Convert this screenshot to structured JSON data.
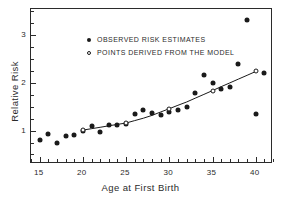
{
  "chart_data": {
    "type": "scatter",
    "title": "",
    "xlabel": "Age at First Birth",
    "ylabel": "Relative Risk",
    "xlim": [
      14,
      42
    ],
    "ylim": [
      0.3,
      3.55
    ],
    "grid": false,
    "xticks_major": [
      15,
      20,
      25,
      30,
      35,
      40
    ],
    "xticklabels": [
      "15",
      "20",
      "25",
      "30",
      "35",
      "40"
    ],
    "xticks_minor": [
      14,
      16,
      17,
      18,
      19,
      21,
      22,
      23,
      24,
      26,
      27,
      28,
      29,
      31,
      32,
      33,
      34,
      36,
      37,
      38,
      39,
      41,
      42
    ],
    "yticks_major": [
      1,
      2,
      3
    ],
    "yticklabels": [
      "1",
      "2",
      "3"
    ],
    "yticks_minor": [
      0.5,
      0.75,
      1.25,
      1.5,
      1.75,
      2.25,
      2.5,
      2.75,
      3.25,
      3.5
    ],
    "legend_position": "upper-left-inside",
    "series": [
      {
        "name": "OBSERVED RISK ESTIMATES",
        "marker": "filled-circle",
        "color": "#1a1a1a",
        "x": [
          15,
          16,
          17,
          18,
          19,
          20,
          21,
          22,
          23,
          24,
          25,
          26,
          27,
          28,
          29,
          30,
          31,
          32,
          33,
          34,
          35,
          36,
          37,
          38,
          39,
          40,
          41
        ],
        "y": [
          0.8,
          0.92,
          0.75,
          0.89,
          0.9,
          1.0,
          1.09,
          0.97,
          1.12,
          1.11,
          1.13,
          1.34,
          1.44,
          1.36,
          1.33,
          1.4,
          1.43,
          1.5,
          1.79,
          2.16,
          2.0,
          1.87,
          1.91,
          2.4,
          3.32,
          1.34,
          2.2
        ]
      },
      {
        "name": "POINTS DERIVED FROM THE MODEL",
        "marker": "open-circle",
        "color": "#1a1a1a",
        "x": [
          20,
          25,
          30,
          35,
          40
        ],
        "y": [
          1.01,
          1.16,
          1.46,
          1.84,
          2.24
        ]
      }
    ],
    "fit_curve": {
      "name": "model-curve",
      "x": [
        20,
        21,
        22,
        23,
        24,
        25,
        26,
        27,
        28,
        29,
        30,
        31,
        32,
        33,
        34,
        35,
        36,
        37,
        38,
        39,
        40
      ],
      "y": [
        1.01,
        1.04,
        1.07,
        1.1,
        1.13,
        1.16,
        1.21,
        1.26,
        1.32,
        1.39,
        1.46,
        1.53,
        1.6,
        1.68,
        1.76,
        1.84,
        1.92,
        2.0,
        2.08,
        2.16,
        2.24
      ]
    }
  },
  "legend": {
    "items": [
      {
        "label": "OBSERVED RISK ESTIMATES",
        "marker": "filled-circle"
      },
      {
        "label": "POINTS DERIVED FROM THE MODEL",
        "marker": "open-circle"
      }
    ]
  },
  "axes": {
    "x_title": "Age at First Birth",
    "y_title": "Relative Risk"
  }
}
